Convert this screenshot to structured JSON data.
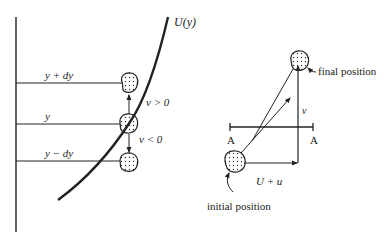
{
  "left_panel": {
    "curve_label": "U(y)",
    "levels": [
      {
        "label": "y + dy"
      },
      {
        "label": "y"
      },
      {
        "label": "y − dy"
      }
    ],
    "velocity_labels": {
      "up": "v > 0",
      "down": "v < 0"
    }
  },
  "right_panel": {
    "final_label": "final position",
    "initial_label": "initial position",
    "vertical_label": "v",
    "horizontal_label": "U + u",
    "plane_left": "A",
    "plane_right": "A"
  },
  "colors": {
    "ink": "#222222",
    "background": "#ffffff"
  }
}
